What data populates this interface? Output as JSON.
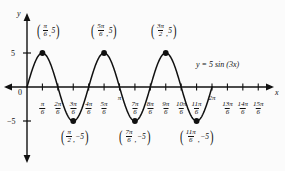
{
  "figure": {
    "kind": "cartesian-graph",
    "background_color": "#fbfbfb",
    "ink_color": "#111111",
    "axis_labels": {
      "x": "x",
      "y": "y",
      "origin": "0"
    },
    "equation_label": {
      "lhs": "y",
      "eq": "=",
      "amplitude": "5",
      "func": "sin",
      "argument": "(3x)",
      "full": "y = 5 sin (3x)"
    },
    "y_ticks": [
      {
        "value": 5,
        "label": "5"
      },
      {
        "value": -5,
        "label": "−5"
      }
    ],
    "x_ticks": [
      {
        "value_over_6": 1,
        "num": "π",
        "den": "6",
        "stacked": true
      },
      {
        "value_over_6": 2,
        "num": "2π",
        "den": "6",
        "stacked": true
      },
      {
        "value_over_6": 3,
        "num": "3π",
        "den": "6",
        "stacked": true
      },
      {
        "value_over_6": 4,
        "num": "4π",
        "den": "6",
        "stacked": true
      },
      {
        "value_over_6": 5,
        "num": "5π",
        "den": "6",
        "stacked": true
      },
      {
        "value_over_6": 6,
        "num": "π",
        "den": "",
        "stacked": false,
        "label": "π"
      },
      {
        "value_over_6": 7,
        "num": "7π",
        "den": "6",
        "stacked": true
      },
      {
        "value_over_6": 8,
        "num": "8π",
        "den": "6",
        "stacked": true
      },
      {
        "value_over_6": 9,
        "num": "9π",
        "den": "6",
        "stacked": true
      },
      {
        "value_over_6": 10,
        "num": "10π",
        "den": "6",
        "stacked": true
      },
      {
        "value_over_6": 11,
        "num": "11π",
        "den": "6",
        "stacked": true
      },
      {
        "value_over_6": 12,
        "num": "2π",
        "den": "",
        "stacked": false,
        "label": "2π"
      },
      {
        "value_over_6": 13,
        "num": "13π",
        "den": "6",
        "stacked": true
      },
      {
        "value_over_6": 14,
        "num": "14π",
        "den": "6",
        "stacked": true
      },
      {
        "value_over_6": 15,
        "num": "15π",
        "den": "6",
        "stacked": true
      }
    ],
    "marked_points": [
      {
        "id": "max-1",
        "x_over_6": 1,
        "y": 5,
        "num": "π",
        "den": "6",
        "yval": "5",
        "placement": "above"
      },
      {
        "id": "min-1",
        "x_over_6": 3,
        "y": -5,
        "num": "π",
        "den": "2",
        "yval": "−5",
        "placement": "below"
      },
      {
        "id": "max-2",
        "x_over_6": 5,
        "y": 5,
        "num": "5π",
        "den": "6",
        "yval": "5",
        "placement": "above"
      },
      {
        "id": "min-2",
        "x_over_6": 7,
        "y": -5,
        "num": "7π",
        "den": "6",
        "yval": "−5",
        "placement": "below"
      },
      {
        "id": "max-3",
        "x_over_6": 9,
        "y": 5,
        "num": "3π",
        "den": "2",
        "yval": "5",
        "placement": "above"
      },
      {
        "id": "min-3",
        "x_over_6": 11,
        "y": -5,
        "num": "11π",
        "den": "6",
        "yval": "−5",
        "placement": "below"
      }
    ]
  },
  "chart_data": {
    "type": "line",
    "title": "",
    "subtitle": "",
    "xlabel": "x",
    "ylabel": "y",
    "function": "y = 5 sin(3x)",
    "amplitude": 5,
    "period_pi_units": 0.6667,
    "grid": false,
    "legend": "none",
    "annotation": "y = 5 sin (3x)",
    "xlim_pi_units": [
      0,
      2.6
    ],
    "ylim": [
      -6.2,
      6.2
    ],
    "x_tick_labels": [
      "π/6",
      "2π/6",
      "3π/6",
      "4π/6",
      "5π/6",
      "π",
      "7π/6",
      "8π/6",
      "9π/6",
      "10π/6",
      "11π/6",
      "2π",
      "13π/6",
      "14π/6",
      "15π/6"
    ],
    "x_tick_values_pi_units": [
      0.1667,
      0.3333,
      0.5,
      0.6667,
      0.8333,
      1.0,
      1.1667,
      1.3333,
      1.5,
      1.6667,
      1.8333,
      2.0,
      2.1667,
      2.3333,
      2.5
    ],
    "y_tick_labels": [
      "5",
      "−5"
    ],
    "y_tick_values": [
      5,
      -5
    ],
    "curve_domain_pi_units": [
      0,
      2
    ],
    "series": [
      {
        "name": "y = 5 sin (3x)",
        "x_pi_units": [
          0,
          0.0833,
          0.1667,
          0.25,
          0.3333,
          0.4167,
          0.5,
          0.5833,
          0.6667,
          0.75,
          0.8333,
          0.9167,
          1.0,
          1.0833,
          1.1667,
          1.25,
          1.3333,
          1.4167,
          1.5,
          1.5833,
          1.6667,
          1.75,
          1.8333,
          1.9167,
          2.0
        ],
        "values": [
          0,
          3.54,
          5,
          3.54,
          0,
          -3.54,
          -5,
          -3.54,
          0,
          3.54,
          5,
          3.54,
          0,
          -3.54,
          -5,
          -3.54,
          0,
          3.54,
          5,
          3.54,
          0,
          -3.54,
          -5,
          -3.54,
          0
        ]
      }
    ],
    "labeled_points": [
      {
        "label": "(π/6, 5)",
        "x_pi_units": 0.1667,
        "y": 5
      },
      {
        "label": "(π/2, −5)",
        "x_pi_units": 0.5,
        "y": -5
      },
      {
        "label": "(5π/6, 5)",
        "x_pi_units": 0.8333,
        "y": 5
      },
      {
        "label": "(7π/6, −5)",
        "x_pi_units": 1.1667,
        "y": -5
      },
      {
        "label": "(3π/2, 5)",
        "x_pi_units": 1.5,
        "y": 5
      },
      {
        "label": "(11π/6, −5)",
        "x_pi_units": 1.8333,
        "y": -5
      }
    ]
  }
}
